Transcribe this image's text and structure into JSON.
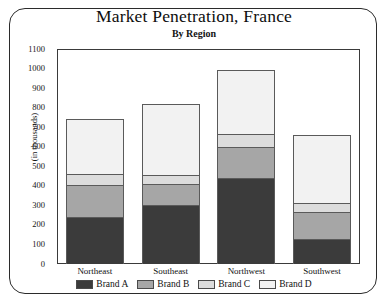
{
  "chart_data": {
    "type": "bar",
    "subtype": "stacked-bar",
    "title": "Market Penetration, France",
    "subtitle": "By Region",
    "xlabel": "",
    "ylabel": "(in thousands)",
    "ylim": [
      0,
      1100
    ],
    "ytick_step": 100,
    "yticks": [
      1100,
      1000,
      900,
      800,
      700,
      600,
      500,
      400,
      300,
      200,
      100,
      0
    ],
    "grid": false,
    "legend_position": "bottom",
    "categories": [
      "Northeast",
      "Southeast",
      "Northwest",
      "Southwest"
    ],
    "series": [
      {
        "name": "Brand A",
        "color": "#3b3b3b",
        "values": [
          240,
          300,
          440,
          130
        ]
      },
      {
        "name": "Brand B",
        "color": "#a6a6a6",
        "values": [
          165,
          110,
          160,
          135
        ]
      },
      {
        "name": "Brand C",
        "color": "#dcdcdc",
        "values": [
          55,
          45,
          65,
          45
        ]
      },
      {
        "name": "Brand D",
        "color": "#f2f2f2",
        "values": [
          280,
          365,
          330,
          350
        ]
      }
    ],
    "totals": [
      740,
      820,
      995,
      660
    ]
  },
  "legend": {
    "items": [
      {
        "label": "Brand A",
        "color": "#3b3b3b"
      },
      {
        "label": "Brand B",
        "color": "#a6a6a6"
      },
      {
        "label": "Brand C",
        "color": "#dcdcdc"
      },
      {
        "label": "Brand D",
        "color": "#f2f2f2"
      }
    ]
  }
}
